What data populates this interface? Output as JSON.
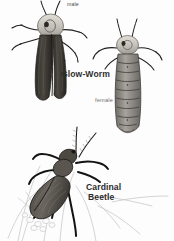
{
  "plate": {
    "background_color": "#fdfdfd",
    "ink_color": "#2f2f2f",
    "panels": [
      {
        "id": "glow-worm-panel",
        "title": "Glow-Worm",
        "specimens": [
          {
            "name": "male",
            "label": "male",
            "description": "winged male glow-worm beetle with dark striated elytra and pale rounded pronotum"
          },
          {
            "name": "female",
            "label": "female",
            "description": "larviform wingless female glow-worm with banded segmented abdomen"
          }
        ]
      },
      {
        "id": "cardinal-beetle-panel",
        "title_line1": "Cardinal",
        "title_line2": "Beetle",
        "specimens": [
          {
            "name": "cardinal-beetle",
            "description": "cardinal beetle with long serrated antennae resting on grass stems"
          }
        ]
      }
    ]
  },
  "labels": {
    "male": "male",
    "female": "female",
    "glow_worm": "Glow-Worm",
    "cardinal": "Cardinal",
    "beetle": "Beetle"
  },
  "colors": {
    "elytra_dark": "#3a3733",
    "elytra_mid": "#57524c",
    "pronotum_light": "#c9c6c0",
    "abdomen_gray": "#8d8a85",
    "line_art": "#b9b9b9",
    "text_dark": "#2f2f2f",
    "text_light": "#6e6e6e"
  }
}
